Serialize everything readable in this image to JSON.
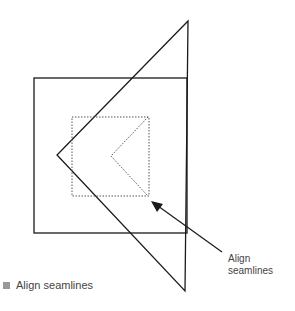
{
  "diagram": {
    "callout_label_line1": "Align",
    "callout_label_line2": "seamlines",
    "legend_label": "Align seamlines",
    "colors": {
      "stroke": "#1a1a1a",
      "dotted": "#555555",
      "swatch": "#999999",
      "text": "#444444"
    }
  }
}
